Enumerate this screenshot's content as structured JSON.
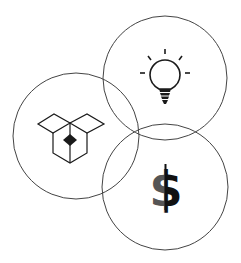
{
  "diagram": {
    "type": "venn",
    "sets": [
      {
        "id": "idea",
        "icon": "lightbulb-icon",
        "center": [
          165,
          78
        ],
        "radius": 62
      },
      {
        "id": "product",
        "icon": "box-icon",
        "center": [
          76,
          136
        ],
        "radius": 63
      },
      {
        "id": "money",
        "icon": "dollar-icon",
        "center": [
          165,
          187
        ],
        "radius": 63
      }
    ],
    "colors": {
      "stroke": "#444444",
      "icon": "#1a1a1a",
      "dollar_left": "#555555",
      "dollar_right": "#111111",
      "background": "#ffffff"
    },
    "dollar_glyph": "$"
  }
}
